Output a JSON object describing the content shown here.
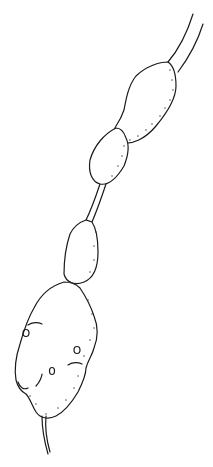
{
  "figure": {
    "colors": {
      "ink": "#1a1a1a",
      "background": "#ffffff"
    },
    "segments": [
      {
        "name": "stalk-top"
      },
      {
        "name": "segment-1"
      },
      {
        "name": "segment-2"
      },
      {
        "name": "segment-3"
      },
      {
        "name": "segment-4-large"
      },
      {
        "name": "tail"
      }
    ]
  }
}
